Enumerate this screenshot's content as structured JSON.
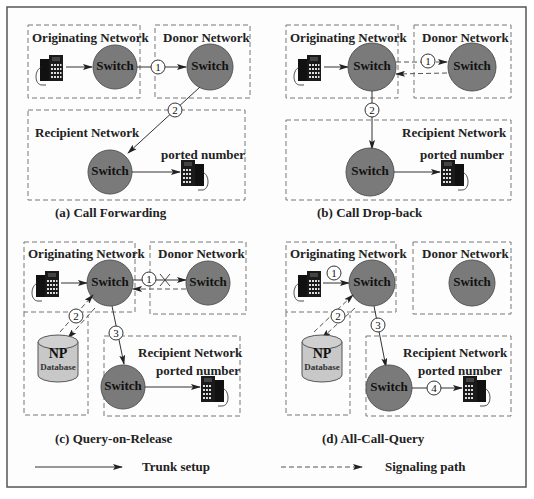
{
  "labels": {
    "originating": "Originating Network",
    "donor": "Donor Network",
    "recipient": "Recipient Network",
    "switch": "Switch",
    "ported": "ported number",
    "np": "NP",
    "database": "Database"
  },
  "panels": [
    {
      "id": "a",
      "caption": "(a) Call  Forwarding",
      "steps": [
        "1",
        "2"
      ]
    },
    {
      "id": "b",
      "caption": "(b) Call Drop-back",
      "steps": [
        "1",
        "2"
      ]
    },
    {
      "id": "c",
      "caption": "(c) Query-on-Release",
      "steps": [
        "1",
        "2",
        "3"
      ]
    },
    {
      "id": "d",
      "caption": "(d) All-Call-Query",
      "steps": [
        "1",
        "2",
        "3",
        "4"
      ]
    }
  ],
  "legend": {
    "trunk": "Trunk setup",
    "signal": "Signaling path"
  },
  "colors": {
    "switch_fill": "#7a7a7a",
    "database_fill": "#c8c8c8",
    "box_stroke": "#777777"
  }
}
